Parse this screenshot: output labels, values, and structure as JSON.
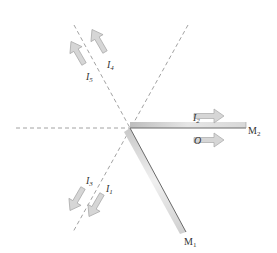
{
  "diagram": {
    "mirrors": [
      {
        "id": "M1",
        "label": "M",
        "sub": "1"
      },
      {
        "id": "M2",
        "label": "M",
        "sub": "2"
      }
    ],
    "beams": [
      {
        "id": "I1",
        "label": "I",
        "sub": "1",
        "direction": "down-left"
      },
      {
        "id": "I2",
        "label": "I",
        "sub": "2",
        "direction": "right"
      },
      {
        "id": "I3",
        "label": "I",
        "sub": "3",
        "direction": "down-left"
      },
      {
        "id": "I4",
        "label": "I",
        "sub": "4",
        "direction": "up-left"
      },
      {
        "id": "I5",
        "label": "I",
        "sub": "5",
        "direction": "up-left"
      },
      {
        "id": "O",
        "label": "O",
        "sub": "",
        "direction": "right"
      }
    ],
    "colors": {
      "dashed_line": "#888888",
      "arrow_fill": "#d4d4d4",
      "arrow_stroke": "#a8a8a8",
      "mirror_dark": "#9a9a9a",
      "mirror_light": "#ececec",
      "text": "#333333"
    }
  }
}
